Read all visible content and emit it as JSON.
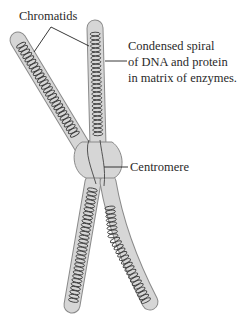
{
  "diagram": {
    "labels": {
      "chromatids": "Chromatids",
      "spiral": [
        "Condensed spiral",
        "of DNA and protein",
        "in matrix of enzymes."
      ],
      "centromere": "Centromere"
    },
    "colors": {
      "chromatid_fill": "#d6d6d6",
      "chromatid_outline": "#8a8a8a",
      "coil": "#3c3c3c",
      "leader_line": "#222222",
      "text": "#2a2a2a"
    }
  }
}
